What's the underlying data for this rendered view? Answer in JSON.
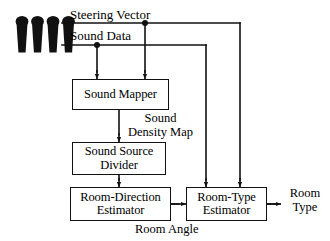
{
  "diagram": {
    "background_color": "#ffffff",
    "line_color": "#111111",
    "text_color": "#000000",
    "source": {
      "name": "microphone-array",
      "icon": "microphone-icon",
      "count": 4
    },
    "signals": [
      {
        "id": "steering_vector",
        "label": "Steering Vector"
      },
      {
        "id": "sound_data",
        "label": "Sound Data"
      },
      {
        "id": "sound_density_map",
        "label": "Sound\nDensity Map"
      },
      {
        "id": "room_angle",
        "label": "Room Angle"
      },
      {
        "id": "room_type",
        "label": "Room\nType"
      }
    ],
    "blocks": [
      {
        "id": "sound_mapper",
        "label": "Sound Mapper"
      },
      {
        "id": "sound_source_divider",
        "label": "Sound Source\nDivider"
      },
      {
        "id": "room_direction_estimator",
        "label": "Room-Direction\nEstimator"
      },
      {
        "id": "room_type_estimator",
        "label": "Room-Type\nEstimator"
      }
    ],
    "connections": [
      {
        "from": "steering_vector",
        "to": "sound_mapper"
      },
      {
        "from": "steering_vector",
        "to": "room_type_estimator"
      },
      {
        "from": "sound_data",
        "to": "sound_mapper"
      },
      {
        "from": "sound_data",
        "to": "room_type_estimator"
      },
      {
        "from": "sound_mapper",
        "to": "sound_source_divider",
        "label": "Sound Density Map"
      },
      {
        "from": "sound_source_divider",
        "to": "room_direction_estimator"
      },
      {
        "from": "room_direction_estimator",
        "to": "room_type_estimator",
        "label": "Room Angle"
      },
      {
        "from": "room_type_estimator",
        "to": "room_type",
        "label": "Room Type"
      }
    ]
  }
}
